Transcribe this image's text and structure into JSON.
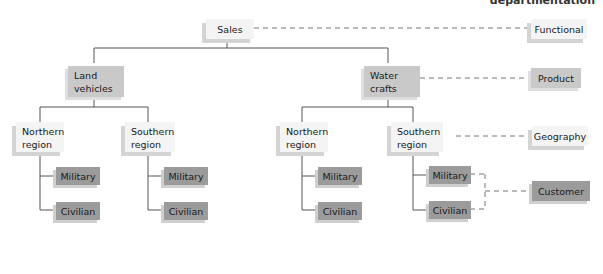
{
  "header": {
    "label": "departmentation"
  },
  "tree": {
    "root": "Sales",
    "divisions": [
      {
        "label": "Land vehicles",
        "label_lines": [
          "Land",
          "vehicles"
        ],
        "regions": [
          {
            "label_lines": [
              "Northern",
              "region"
            ],
            "customers": [
              "Military",
              "Civilian"
            ]
          },
          {
            "label_lines": [
              "Southern",
              "region"
            ],
            "customers": [
              "Military",
              "Civilian"
            ]
          }
        ]
      },
      {
        "label": "Water crafts",
        "label_lines": [
          "Water",
          "crafts"
        ],
        "regions": [
          {
            "label_lines": [
              "Northern",
              "region"
            ],
            "customers": [
              "Military",
              "Civilian"
            ]
          },
          {
            "label_lines": [
              "Southern",
              "region"
            ],
            "customers": [
              "Military",
              "Civilian"
            ]
          }
        ]
      }
    ]
  },
  "legend": {
    "functional": "Functional",
    "product": "Product",
    "geography": "Geography",
    "customer": "Customer"
  }
}
